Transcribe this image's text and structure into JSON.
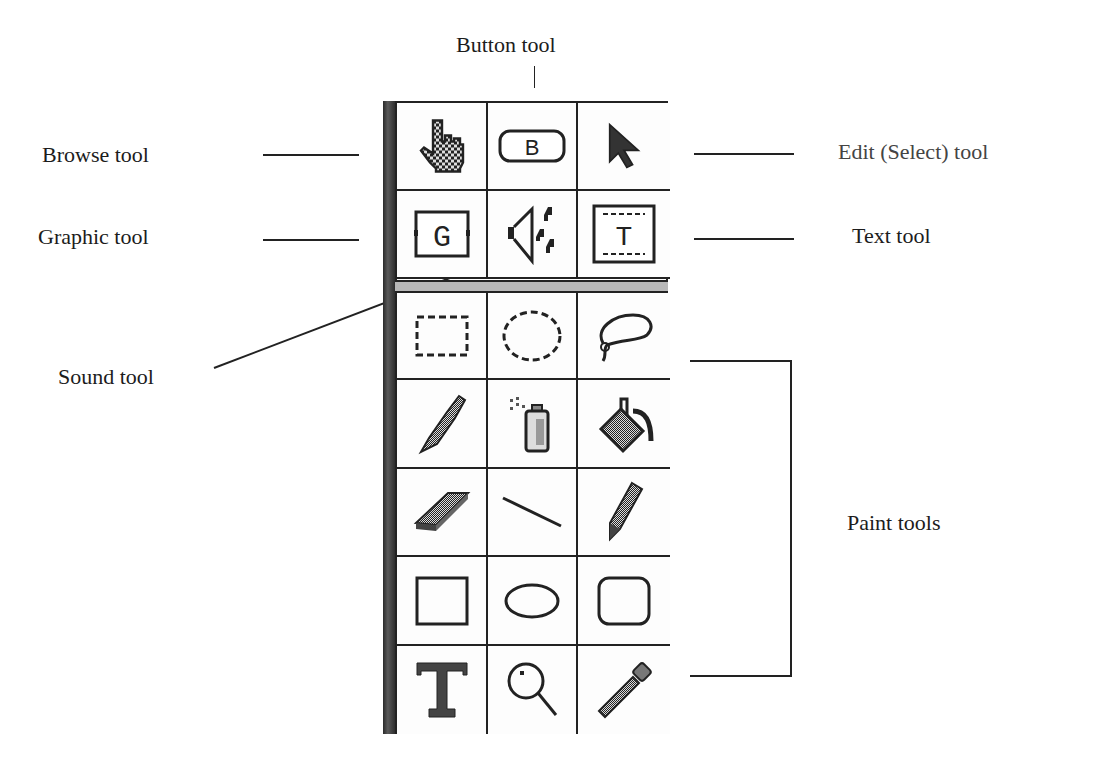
{
  "labels": {
    "button_tool": "Button tool",
    "browse_tool": "Browse tool",
    "edit_tool": "Edit (Select) tool",
    "graphic_tool": "Graphic tool",
    "text_tool": "Text tool",
    "sound_tool": "Sound tool",
    "paint_tools": "Paint tools"
  },
  "palette": {
    "authoring_tools": [
      {
        "name": "browse",
        "icon": "hand-pointer-icon"
      },
      {
        "name": "button",
        "icon": "button-b-icon",
        "glyph": "B"
      },
      {
        "name": "edit-select",
        "icon": "arrow-pointer-icon"
      },
      {
        "name": "graphic",
        "icon": "graphic-g-icon",
        "glyph": "G"
      },
      {
        "name": "sound",
        "icon": "speaker-notes-icon"
      },
      {
        "name": "text-field",
        "icon": "text-field-t-icon",
        "glyph": "T"
      }
    ],
    "paint_tools": [
      {
        "name": "marquee-select",
        "icon": "dashed-rectangle-icon"
      },
      {
        "name": "oval-select",
        "icon": "dashed-oval-icon"
      },
      {
        "name": "lasso",
        "icon": "lasso-icon"
      },
      {
        "name": "brush",
        "icon": "brush-icon"
      },
      {
        "name": "spray-can",
        "icon": "spray-can-icon"
      },
      {
        "name": "paint-bucket",
        "icon": "paint-bucket-icon"
      },
      {
        "name": "eraser",
        "icon": "eraser-icon"
      },
      {
        "name": "line",
        "icon": "line-icon"
      },
      {
        "name": "pencil",
        "icon": "pencil-icon"
      },
      {
        "name": "rectangle",
        "icon": "rectangle-icon"
      },
      {
        "name": "oval",
        "icon": "oval-icon"
      },
      {
        "name": "rounded-rectangle",
        "icon": "rounded-rectangle-icon"
      },
      {
        "name": "paint-text",
        "icon": "paint-text-t-icon",
        "glyph": "T"
      },
      {
        "name": "magnifier",
        "icon": "magnifier-icon"
      },
      {
        "name": "eyedropper",
        "icon": "eyedropper-icon"
      }
    ]
  }
}
